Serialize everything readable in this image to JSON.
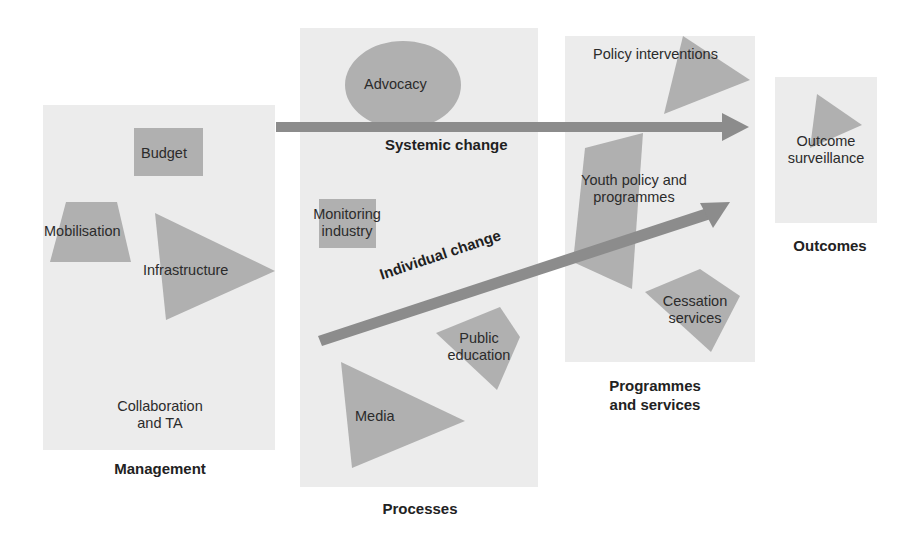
{
  "diagram": {
    "colors": {
      "panel_fill": "#ececec",
      "shape_fill": "#b0b0b0",
      "arrow_fill": "#8c8c8c",
      "text": "#2b2b2b",
      "background": "#ffffff"
    },
    "columns": [
      {
        "id": "management",
        "label": "Management",
        "items": [
          "Budget",
          "Mobilisation",
          "Infrastructure",
          "Collaboration and TA"
        ]
      },
      {
        "id": "processes",
        "label": "Processes",
        "items": [
          "Advocacy",
          "Monitoring industry",
          "Public education",
          "Media"
        ]
      },
      {
        "id": "programmes",
        "label": "Programmes and services",
        "items": [
          "Policy interventions",
          "Youth policy and programmes",
          "Cessation services"
        ]
      },
      {
        "id": "outcomes",
        "label": "Outcomes",
        "items": [
          "Outcome surveillance"
        ]
      }
    ],
    "labels": {
      "budget": "Budget",
      "mobilisation": "Mobilisation",
      "infrastructure": "Infrastructure",
      "collaboration_1": "Collaboration",
      "collaboration_2": "and TA",
      "management": "Management",
      "advocacy": "Advocacy",
      "monitoring_1": "Monitoring",
      "monitoring_2": "industry",
      "public_1": "Public",
      "public_2": "education",
      "media": "Media",
      "processes": "Processes",
      "policy": "Policy interventions",
      "youth_1": "Youth policy and",
      "youth_2": "programmes",
      "cessation_1": "Cessation",
      "cessation_2": "services",
      "programmes_1": "Programmes",
      "programmes_2": "and services",
      "outcome_1": "Outcome",
      "outcome_2": "surveillance",
      "outcomes": "Outcomes"
    },
    "arrows": {
      "systemic": "Systemic change",
      "individual": "Individual change"
    }
  }
}
